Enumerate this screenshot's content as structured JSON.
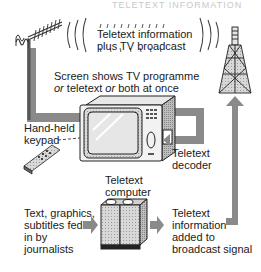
{
  "diagram": {
    "header_faded": "TELETEXT INFORMATION",
    "labels": {
      "broadcast_line1": "Teletext information",
      "broadcast_line2": "plus TV broadcast",
      "screen_line1": "Screen shows TV programme",
      "screen_line2_a": "or",
      "screen_line2_b": " teletext ",
      "screen_line2_c": "or",
      "screen_line2_d": " both at once",
      "keypad_line1": "Hand-held",
      "keypad_line2": "keypad",
      "decoder_line1": "Teletext",
      "decoder_line2": "decoder",
      "computer_line1": "Teletext",
      "computer_line2": "computer",
      "journalists_line1": "Text, graphics,",
      "journalists_line2": "subtitles fed",
      "journalists_line3": "in by",
      "journalists_line4": "journalists",
      "added_line1": "Teletext",
      "added_line2": "information",
      "added_line3": "added to",
      "added_line4": "broadcast signal"
    },
    "components": [
      "roof-antenna",
      "broadcast-waves",
      "transmitter-tower",
      "television-set",
      "hand-held-keypad",
      "teletext-decoder",
      "teletext-computer",
      "signal-flow-arrows"
    ],
    "colors": {
      "arrow_gray": "#8a8a8a",
      "dark_gray": "#555555",
      "text": "#1a1a1a"
    }
  }
}
